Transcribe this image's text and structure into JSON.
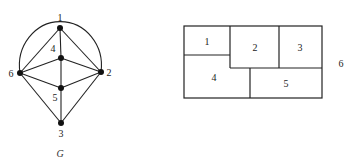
{
  "graph": {
    "caption": "G",
    "vertices": [
      {
        "id": "1",
        "label": "1",
        "x": 60,
        "y": 28,
        "lx": 60,
        "ly": 21
      },
      {
        "id": "2",
        "label": "2",
        "x": 101,
        "y": 72,
        "lx": 109,
        "ly": 76
      },
      {
        "id": "3",
        "label": "3",
        "x": 61,
        "y": 123,
        "lx": 61,
        "ly": 137
      },
      {
        "id": "4",
        "label": "4",
        "x": 61,
        "y": 58,
        "lx": 53,
        "ly": 52
      },
      {
        "id": "5",
        "label": "5",
        "x": 61,
        "y": 88,
        "lx": 55,
        "ly": 101
      },
      {
        "id": "6",
        "label": "6",
        "x": 20,
        "y": 73,
        "lx": 11,
        "ly": 77
      }
    ],
    "edges": [
      [
        "1",
        "4"
      ],
      [
        "1",
        "6"
      ],
      [
        "1",
        "2"
      ],
      [
        "4",
        "6"
      ],
      [
        "4",
        "2"
      ],
      [
        "4",
        "5"
      ],
      [
        "5",
        "6"
      ],
      [
        "5",
        "2"
      ],
      [
        "5",
        "3"
      ],
      [
        "6",
        "3"
      ],
      [
        "2",
        "3"
      ],
      [
        "6",
        "2",
        "outer-arc"
      ]
    ]
  },
  "rectangular_dual": {
    "outer_label": "6",
    "regions": [
      {
        "label": "1"
      },
      {
        "label": "2"
      },
      {
        "label": "3"
      },
      {
        "label": "4"
      },
      {
        "label": "5"
      }
    ]
  }
}
